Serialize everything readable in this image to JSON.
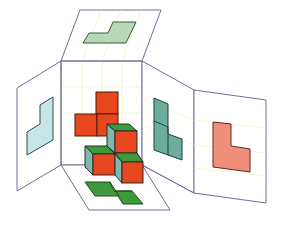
{
  "diagram": {
    "colors": {
      "panel_edge": "#6e6e9a",
      "grid": "#f0f0c8",
      "cube_front": "#e8461e",
      "cube_top": "#3c9a3c",
      "cube_side": "#7fb8ac",
      "outline": "#2a2a2a",
      "top_view": "#b8d8b8",
      "left_view": "#c8e6e6",
      "side_view": "#6cae9e",
      "right_view": "#f0907a",
      "floor_view": "#3c9a3c",
      "back_view": "#e8461e"
    },
    "panels": [
      {
        "name": "top-projection-panel",
        "label": "Top view"
      },
      {
        "name": "left-projection-panel",
        "label": "Left view"
      },
      {
        "name": "back-projection-panel",
        "label": "Back view"
      },
      {
        "name": "side-projection-panel",
        "label": "Side view"
      },
      {
        "name": "right-projection-panel",
        "label": "Right view"
      },
      {
        "name": "floor-projection-panel",
        "label": "Bottom view"
      }
    ]
  }
}
